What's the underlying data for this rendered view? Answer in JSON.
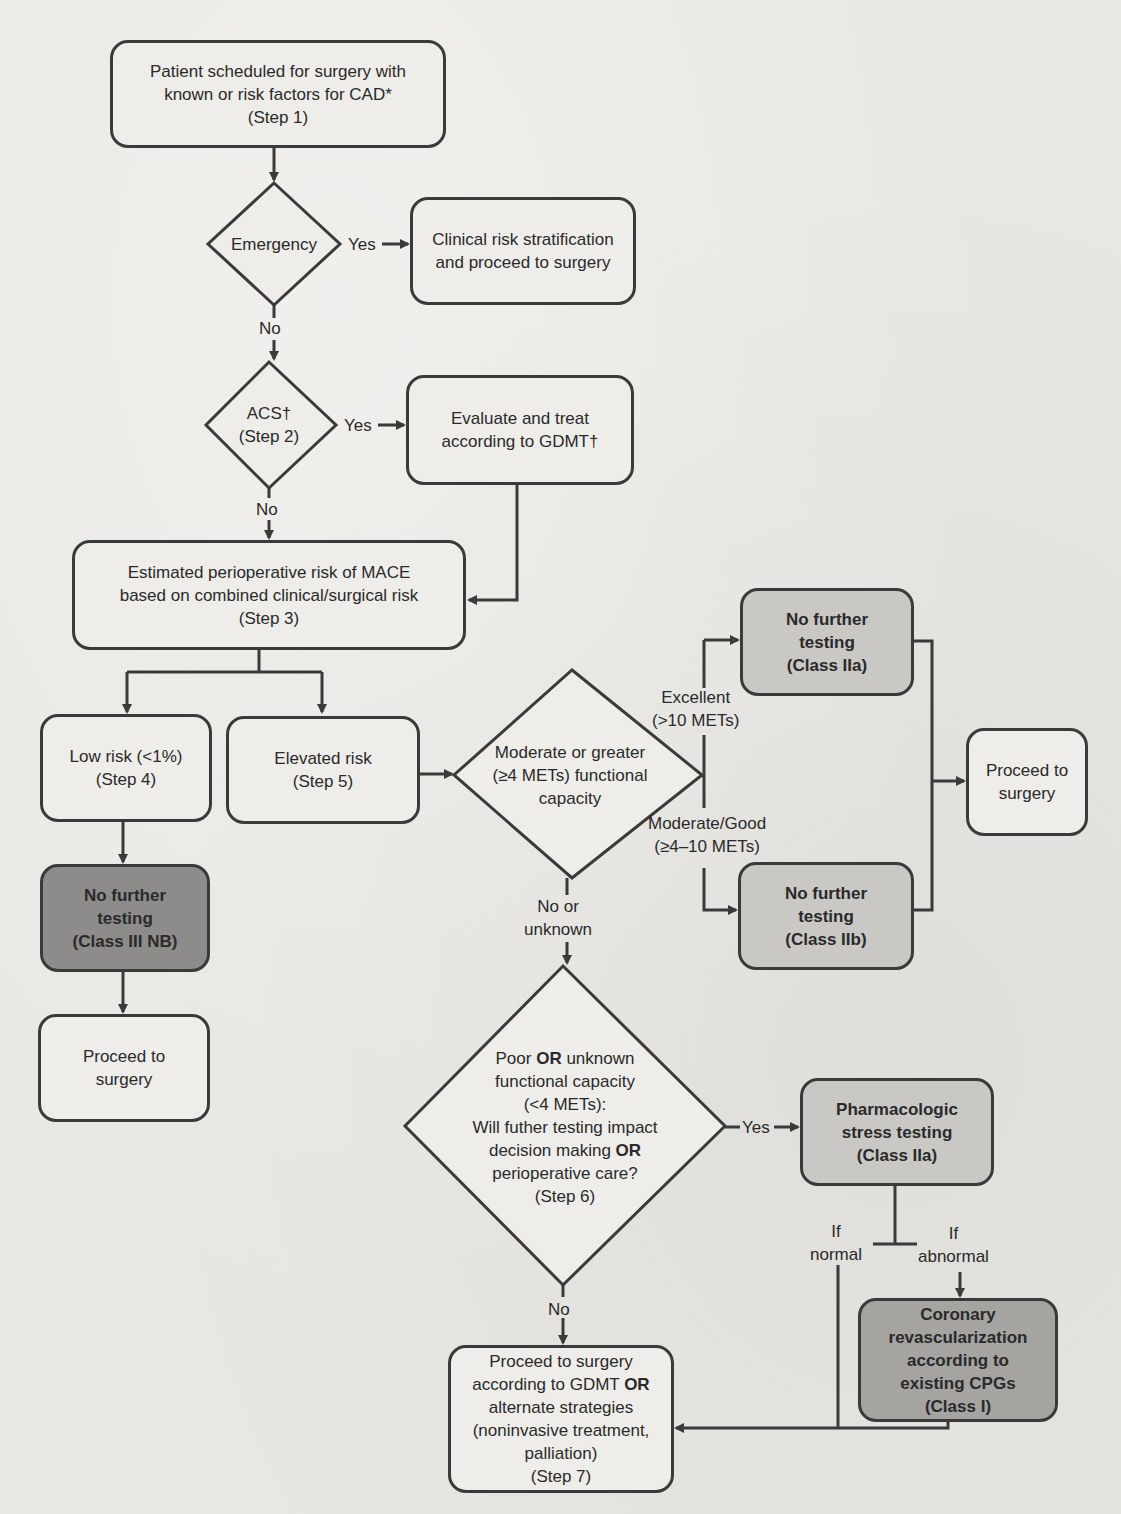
{
  "flowchart": {
    "step1": {
      "line1": "Patient scheduled for surgery with",
      "line2": "known or risk factors for CAD*",
      "line3": "(Step 1)"
    },
    "emergency": {
      "label": "Emergency"
    },
    "emergency_yes_box": {
      "line1": "Clinical risk stratification",
      "line2": "and proceed to surgery"
    },
    "acs": {
      "line1": "ACS†",
      "line2": "(Step 2)"
    },
    "acs_yes_box": {
      "line1": "Evaluate and treat",
      "line2": "according to GDMT†"
    },
    "step3": {
      "line1": "Estimated perioperative risk of MACE",
      "line2": "based on combined clinical/surgical risk",
      "line3": "(Step 3)"
    },
    "step4": {
      "line1": "Low risk (<1%)",
      "line2": "(Step 4)"
    },
    "step5": {
      "line1": "Elevated risk",
      "line2": "(Step 5)"
    },
    "class3nb": {
      "line1": "No further",
      "line2": "testing",
      "line3": "(Class III NB)"
    },
    "proceed_left": {
      "line1": "Proceed to",
      "line2": "surgery"
    },
    "functional": {
      "line1": "Moderate or greater",
      "line2": "(≥4 METs) functional",
      "line3": "capacity"
    },
    "excellent": {
      "line1": "Excellent",
      "line2": "(>10 METs)"
    },
    "moderate_good": {
      "line1": "Moderate/Good",
      "line2": "(≥4–10 METs)"
    },
    "class2a_top": {
      "line1": "No further",
      "line2": "testing",
      "line3": "(Class IIa)"
    },
    "class2b": {
      "line1": "No further",
      "line2": "testing",
      "line3": "(Class IIb)"
    },
    "proceed_right": {
      "line1": "Proceed to",
      "line2": "surgery"
    },
    "no_or_unknown": {
      "line1": "No or",
      "line2": "unknown"
    },
    "step6": {
      "l1a": "Poor ",
      "l1b": "OR",
      "l1c": " unknown",
      "l2": "functional capacity",
      "l3": "(<4 METs):",
      "l4": "Will futher testing impact",
      "l5a": "decision making ",
      "l5b": "OR",
      "l6": "perioperative care?",
      "l7": "(Step 6)"
    },
    "pharm": {
      "line1": "Pharmacologic",
      "line2": "stress testing",
      "line3": "(Class IIa)"
    },
    "if_normal": {
      "line1": "If",
      "line2": "normal"
    },
    "if_abnormal": {
      "line1": "If",
      "line2": "abnormal"
    },
    "revasc": {
      "line1": "Coronary",
      "line2": "revascularization",
      "line3": "according to",
      "line4": "existing CPGs",
      "line5": "(Class I)"
    },
    "step7": {
      "l1": "Proceed to surgery",
      "l2a": "according to GDMT ",
      "l2b": "OR",
      "l3": "alternate strategies",
      "l4": "(noninvasive treatment,",
      "l5": "palliation)",
      "l6": "(Step 7)"
    },
    "yes": "Yes",
    "no": "No",
    "colors": {
      "line": "#3a3a3a",
      "box": "#eeede9",
      "light": "#c9c8c5",
      "mid": "#a5a4a1",
      "dark": "#8d8c8a"
    }
  }
}
